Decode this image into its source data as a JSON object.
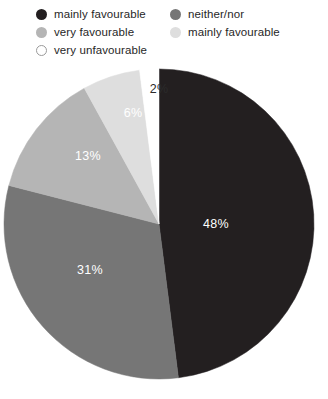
{
  "legend": {
    "columns": [
      {
        "items": [
          {
            "label": "mainly favourable",
            "swatch_color": "#231f20",
            "swatch_border": "#231f20"
          },
          {
            "label": "very favourable",
            "swatch_color": "#b5b5b5",
            "swatch_border": "#b5b5b5"
          },
          {
            "label": "very unfavourable",
            "swatch_color": "#ffffff",
            "swatch_border": "#9a9a9a"
          }
        ]
      },
      {
        "items": [
          {
            "label": "neither/nor",
            "swatch_color": "#767676",
            "swatch_border": "#767676"
          },
          {
            "label": "mainly favourable",
            "swatch_color": "#dedede",
            "swatch_border": "#dedede"
          }
        ]
      }
    ]
  },
  "chart_data": {
    "type": "pie",
    "title": "",
    "legend_position": "top",
    "grid": false,
    "start_angle_deg": 0,
    "direction": "clockwise",
    "center": {
      "x": 159,
      "y": 164,
      "r": 155
    },
    "categories": [
      "mainly favourable",
      "neither/nor",
      "very favourable",
      "mainly favourable",
      "very unfavourable"
    ],
    "values": [
      48,
      31,
      13,
      6,
      2
    ],
    "labels": [
      "48%",
      "31%",
      "13%",
      "6%",
      "2%"
    ],
    "colors": [
      "#231f20",
      "#767676",
      "#b5b5b5",
      "#dedede",
      "#ffffff"
    ],
    "slices": [
      {
        "label": "48%",
        "value": 48,
        "color": "#231f20",
        "label_color": "#ffffff",
        "label_x": 216,
        "label_y": 164
      },
      {
        "label": "31%",
        "value": 31,
        "color": "#767676",
        "label_color": "#ffffff",
        "label_y": 210,
        "label_x": 90
      },
      {
        "label": "13%",
        "value": 13,
        "color": "#b5b5b5",
        "label_color": "#ffffff",
        "label_x": 88,
        "label_y": 96
      },
      {
        "label": "6%",
        "value": 6,
        "color": "#dedede",
        "label_color": "#ffffff",
        "label_x": 133,
        "label_y": 53
      },
      {
        "label": "2%",
        "value": 2,
        "color": "#ffffff",
        "label_color": "#2b2b2b",
        "label_x": 159,
        "label_y": 29
      }
    ]
  }
}
